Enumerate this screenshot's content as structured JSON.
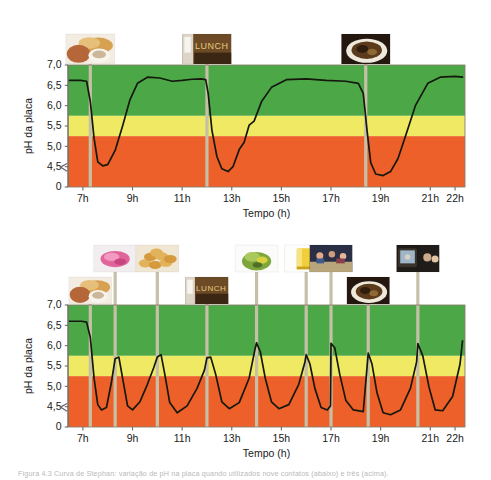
{
  "figure": {
    "caption_bottom": "Figura 4.3  Curva de Stephan: variação de pH na placa quando utilizados nove contatos (abaixo) e três (acima).",
    "caption_top": ""
  },
  "axis": {
    "ylabel": "pH da placa",
    "xlabel": "Tempo (h)",
    "yticks": [
      "7,0",
      "6,5",
      "6,0",
      "5,5",
      "5,0",
      "4,5",
      "0"
    ],
    "xticks": [
      "7h",
      "9h",
      "11h",
      "13h",
      "15h",
      "17h",
      "19h",
      "21h",
      "22h"
    ],
    "break_symbol": "axis-break"
  },
  "colors": {
    "green": "#4CA847",
    "yellow": "#EFE963",
    "orange": "#EE6029",
    "curve": "#14180d",
    "stem": "#c6c0a8",
    "frame": "#6b6b6b",
    "text": "#1a1a1a"
  },
  "bands": {
    "green_label": "zona segura",
    "yellow_label": "zona de risco",
    "orange_label": "zona de desmineralização",
    "green_range": [
      5.75,
      7.0
    ],
    "yellow_range": [
      5.25,
      5.75
    ],
    "orange_range": [
      0,
      5.25
    ]
  },
  "chart_data": [
    {
      "id": "stephan-curve-three-meals",
      "type": "line",
      "title": "Três contatos com alimento",
      "xlabel": "Tempo (h)",
      "ylabel": "pH da placa",
      "xlim": [
        6.4,
        22.4
      ],
      "ylim": [
        4.0,
        7.0
      ],
      "yticks": [
        4.5,
        5.0,
        5.5,
        6.0,
        6.5,
        7.0
      ],
      "xticks": [
        7,
        9,
        11,
        13,
        15,
        17,
        19,
        21,
        22
      ],
      "grid": false,
      "legend": "none",
      "critical_ph": 5.5,
      "events": [
        {
          "time": 7.3,
          "label": "Café da manhã",
          "icon": "breakfast-photo"
        },
        {
          "time": 12.0,
          "label": "Almoço",
          "icon": "lunch-sign-photo"
        },
        {
          "time": 18.4,
          "label": "Jantar",
          "icon": "dinner-photo"
        }
      ],
      "x": [
        6.45,
        6.9,
        7.15,
        7.3,
        7.45,
        7.6,
        7.8,
        8.0,
        8.3,
        8.6,
        8.9,
        9.2,
        9.6,
        10.1,
        10.6,
        11.0,
        11.4,
        11.75,
        11.95,
        12.05,
        12.2,
        12.4,
        12.6,
        12.85,
        13.05,
        13.3,
        13.5,
        13.7,
        13.9,
        14.2,
        14.6,
        15.2,
        16.0,
        16.8,
        17.6,
        18.1,
        18.3,
        18.45,
        18.6,
        18.8,
        19.1,
        19.4,
        19.7,
        20.0,
        20.4,
        20.9,
        21.4,
        22.0,
        22.3
      ],
      "y": [
        6.62,
        6.62,
        6.6,
        6.1,
        5.2,
        4.62,
        4.52,
        4.55,
        4.9,
        5.5,
        6.15,
        6.55,
        6.7,
        6.68,
        6.6,
        6.62,
        6.65,
        6.66,
        6.64,
        6.3,
        5.4,
        4.75,
        4.45,
        4.38,
        4.5,
        4.92,
        5.1,
        5.52,
        5.62,
        6.1,
        6.45,
        6.64,
        6.66,
        6.62,
        6.6,
        6.55,
        6.3,
        5.4,
        4.6,
        4.32,
        4.28,
        4.38,
        4.7,
        5.25,
        6.0,
        6.55,
        6.7,
        6.72,
        6.7
      ]
    },
    {
      "id": "stephan-curve-nine-contacts",
      "type": "line",
      "title": "Nove contatos com alimento",
      "xlabel": "Tempo (h)",
      "ylabel": "pH da placa",
      "xlim": [
        6.4,
        22.4
      ],
      "ylim": [
        4.0,
        7.0
      ],
      "yticks": [
        4.5,
        5.0,
        5.5,
        6.0,
        6.5,
        7.0
      ],
      "xticks": [
        7,
        9,
        11,
        13,
        15,
        17,
        19,
        21,
        22
      ],
      "grid": false,
      "legend": "none",
      "critical_ph": 5.5,
      "events": [
        {
          "time": 7.3,
          "label": "Café da manhã",
          "icon": "breakfast-photo",
          "row": "low"
        },
        {
          "time": 8.3,
          "label": "Bala",
          "icon": "candy-photo",
          "row": "high"
        },
        {
          "time": 10.0,
          "label": "Biscoitos",
          "icon": "cookies-photo",
          "row": "high"
        },
        {
          "time": 12.0,
          "label": "Almoço",
          "icon": "lunch-sign-photo",
          "row": "low"
        },
        {
          "time": 14.0,
          "label": "Salada",
          "icon": "salad-photo",
          "row": "high"
        },
        {
          "time": 16.0,
          "label": "Suco",
          "icon": "juice-photo",
          "row": "high"
        },
        {
          "time": 17.0,
          "label": "Lanche",
          "icon": "snack-party-photo",
          "row": "high"
        },
        {
          "time": 18.5,
          "label": "Jantar",
          "icon": "dinner-photo",
          "row": "low"
        },
        {
          "time": 20.5,
          "label": "TV",
          "icon": "tv-photo",
          "row": "high"
        }
      ],
      "x": [
        6.45,
        6.95,
        7.15,
        7.3,
        7.45,
        7.6,
        7.75,
        7.95,
        8.15,
        8.3,
        8.45,
        8.6,
        8.8,
        9.0,
        9.3,
        9.6,
        9.85,
        10.0,
        10.15,
        10.3,
        10.5,
        10.8,
        11.2,
        11.6,
        11.9,
        12.0,
        12.15,
        12.35,
        12.6,
        12.9,
        13.3,
        13.7,
        13.95,
        14.0,
        14.15,
        14.35,
        14.6,
        14.9,
        15.3,
        15.7,
        15.95,
        16.0,
        16.15,
        16.35,
        16.6,
        16.85,
        16.98,
        17.0,
        17.15,
        17.35,
        17.6,
        17.9,
        18.3,
        18.5,
        18.65,
        18.85,
        19.1,
        19.4,
        19.8,
        20.2,
        20.45,
        20.5,
        20.7,
        20.95,
        21.2,
        21.5,
        21.9,
        22.2,
        22.3
      ],
      "y": [
        6.6,
        6.6,
        6.58,
        6.2,
        5.2,
        4.55,
        4.42,
        4.48,
        5.1,
        5.68,
        5.72,
        5.2,
        4.52,
        4.42,
        4.62,
        5.05,
        5.45,
        5.72,
        5.78,
        5.3,
        4.6,
        4.35,
        4.52,
        4.95,
        5.4,
        5.7,
        5.72,
        5.3,
        4.62,
        4.45,
        4.6,
        5.2,
        5.95,
        6.07,
        5.85,
        5.2,
        4.62,
        4.45,
        4.55,
        5.05,
        5.6,
        5.78,
        5.55,
        4.95,
        4.48,
        4.42,
        4.52,
        6.06,
        5.95,
        5.3,
        4.65,
        4.42,
        4.38,
        5.82,
        5.55,
        4.85,
        4.35,
        4.3,
        4.42,
        4.95,
        5.6,
        6.05,
        5.75,
        4.98,
        4.42,
        4.4,
        4.75,
        5.55,
        6.12
      ]
    }
  ]
}
